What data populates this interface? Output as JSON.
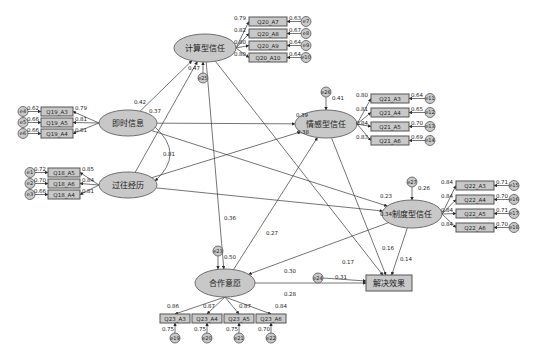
{
  "latents": [
    {
      "id": "calc",
      "label": "计算型信任",
      "cx": 205,
      "cy": 48,
      "rx": 31,
      "ry": 14,
      "error": "e25",
      "err_coef": "0.47"
    },
    {
      "id": "timely",
      "label": "即时信息",
      "cx": 128,
      "cy": 123,
      "rx": 29,
      "ry": 13
    },
    {
      "id": "past",
      "label": "过往经历",
      "cx": 128,
      "cy": 185,
      "rx": 29,
      "ry": 13
    },
    {
      "id": "emot",
      "label": "情感型信任",
      "cx": 326,
      "cy": 124,
      "rx": 31,
      "ry": 14,
      "error": "e26",
      "err_coef": "0.41"
    },
    {
      "id": "inst",
      "label": "制度型信任",
      "cx": 412,
      "cy": 214,
      "rx": 30,
      "ry": 14,
      "error": "e27",
      "err_coef": "0.26"
    },
    {
      "id": "coop",
      "label": "合作意愿",
      "cx": 225,
      "cy": 283,
      "rx": 30,
      "ry": 14,
      "error": "e23",
      "err_coef": "0.50"
    }
  ],
  "outcome": {
    "id": "resolve",
    "label": "解决效果",
    "x": 366,
    "y": 275,
    "w": 46,
    "h": 16,
    "error": "e24",
    "err_coef": "0.31"
  },
  "indicators": {
    "calc": [
      {
        "label": "Q20_A7",
        "loading": "0.79",
        "err": "e7",
        "err_coef": "0.63"
      },
      {
        "label": "Q20_A8",
        "loading": "0.82",
        "err": "e8",
        "err_coef": "0.67"
      },
      {
        "label": "Q20_A9",
        "loading": "0.80",
        "err": "e9",
        "err_coef": "0.64"
      },
      {
        "label": "Q20_A10",
        "loading": "0.80",
        "err": "e10",
        "err_coef": "0.64"
      }
    ],
    "timely": [
      {
        "label": "Q19_A3",
        "loading": "0.79",
        "err": "e4",
        "err_coef": "0.62"
      },
      {
        "label": "Q19_A5",
        "loading": "0.81",
        "err": "e5",
        "err_coef": "0.66"
      },
      {
        "label": "Q19_A4",
        "loading": "0.81",
        "err": "e6",
        "err_coef": "0.66"
      }
    ],
    "past": [
      {
        "label": "Q18_A5",
        "loading": "0.85",
        "err": "e1",
        "err_coef": "0.72"
      },
      {
        "label": "Q18_A6",
        "loading": "0.84",
        "err": "e2",
        "err_coef": "0.70"
      },
      {
        "label": "Q18_A4",
        "loading": "0.81",
        "err": "e3",
        "err_coef": "0.66"
      }
    ],
    "emot": [
      {
        "label": "Q21_A3",
        "loading": "0.80",
        "err": "e11",
        "err_coef": "0.64"
      },
      {
        "label": "Q21_A4",
        "loading": "0.81",
        "err": "e12",
        "err_coef": "0.65"
      },
      {
        "label": "Q21_A5",
        "loading": "0.84",
        "err": "e13",
        "err_coef": "0.70"
      },
      {
        "label": "Q21_A6",
        "loading": "0.83",
        "err": "e14",
        "err_coef": "0.69"
      }
    ],
    "inst": [
      {
        "label": "Q22_A3",
        "loading": "0.84",
        "err": "e15",
        "err_coef": "0.71"
      },
      {
        "label": "Q22_A4",
        "loading": "0.84",
        "err": "e16",
        "err_coef": "0.70"
      },
      {
        "label": "Q22_A5",
        "loading": "0.84",
        "err": "e17",
        "err_coef": "0.71"
      },
      {
        "label": "Q22_A6",
        "loading": "0.84",
        "err": "e18",
        "err_coef": "0.70"
      }
    ],
    "coop": [
      {
        "label": "Q23_A3",
        "loading": "0.86",
        "err": "e19",
        "err_coef": "0.75"
      },
      {
        "label": "Q23_A4",
        "loading": "0.87",
        "err": "e20",
        "err_coef": "0.75"
      },
      {
        "label": "Q23_A5",
        "loading": "0.87",
        "err": "e21",
        "err_coef": "0.75"
      },
      {
        "label": "Q23_A6",
        "loading": "0.84",
        "err": "e22",
        "err_coef": "0.70"
      }
    ]
  },
  "paths": [
    {
      "from": "timely",
      "to": "calc",
      "coef": "0.42"
    },
    {
      "from": "past",
      "to": "calc",
      "coef": "0.37"
    },
    {
      "from": "timely",
      "to": "emot",
      "coef": "0.39"
    },
    {
      "from": "past",
      "to": "emot",
      "coef": "0.38"
    },
    {
      "from": "timely",
      "to": "inst",
      "coef": "0.23"
    },
    {
      "from": "past",
      "to": "inst",
      "coef": "0.34"
    },
    {
      "from": "calc",
      "to": "coop",
      "coef": "0.36"
    },
    {
      "from": "coop",
      "to": "emot",
      "coef": "0.27"
    },
    {
      "from": "inst",
      "to": "coop",
      "coef": "0.30"
    },
    {
      "from": "coop",
      "to": "resolve",
      "coef": "0.28"
    },
    {
      "from": "calc",
      "to": "resolve",
      "coef": "0.17"
    },
    {
      "from": "emot",
      "to": "resolve",
      "coef": "0.16"
    },
    {
      "from": "inst",
      "to": "resolve",
      "coef": "0.14"
    }
  ],
  "covariance": {
    "between": [
      "timely",
      "past"
    ],
    "coef": "0.81"
  }
}
